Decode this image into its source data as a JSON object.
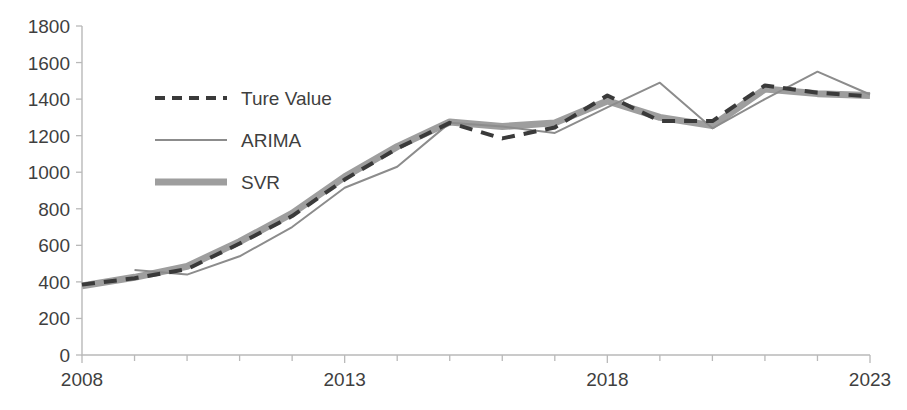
{
  "chart_data": {
    "type": "line",
    "title": "",
    "xlabel": "",
    "ylabel": "",
    "xlim": [
      2008,
      2023
    ],
    "ylim": [
      0,
      1800
    ],
    "grid": false,
    "legend_position": "upper-left-inside",
    "x": [
      2008,
      2009,
      2010,
      2011,
      2012,
      2013,
      2014,
      2015,
      2016,
      2017,
      2018,
      2019,
      2020,
      2021,
      2022,
      2023
    ],
    "xticks": [
      2008,
      2013,
      2018,
      2023
    ],
    "xtick_labels": [
      "2008",
      "2013",
      "2018",
      "2023"
    ],
    "xticks_minor": [
      2009,
      2010,
      2011,
      2012,
      2014,
      2015,
      2016,
      2017,
      2019,
      2020,
      2021,
      2022
    ],
    "yticks": [
      0,
      200,
      400,
      600,
      800,
      1000,
      1200,
      1400,
      1600,
      1800
    ],
    "ytick_labels": [
      "0",
      "200",
      "400",
      "600",
      "800",
      "1000",
      "1200",
      "1400",
      "1600",
      "1800"
    ],
    "series": [
      {
        "name": "Ture Value",
        "style": "dashed",
        "color": "#3a3a3a",
        "width": 4,
        "x": [
          2008,
          2009,
          2010,
          2011,
          2012,
          2013,
          2014,
          2015,
          2016,
          2017,
          2018,
          2019,
          2020,
          2021,
          2022,
          2023
        ],
        "values": [
          385,
          420,
          470,
          610,
          760,
          960,
          1130,
          1270,
          1185,
          1245,
          1420,
          1280,
          1280,
          1475,
          1435,
          1415
        ]
      },
      {
        "name": "ARIMA",
        "style": "solid-thin",
        "color": "#8c8c8c",
        "width": 2,
        "x": [
          2009,
          2010,
          2011,
          2012,
          2013,
          2014,
          2015,
          2016,
          2017,
          2018,
          2019,
          2020,
          2021,
          2022,
          2023
        ],
        "values": [
          465,
          440,
          540,
          700,
          915,
          1030,
          1270,
          1250,
          1215,
          1355,
          1490,
          1240,
          1400,
          1550,
          1425
        ]
      },
      {
        "name": "SVR",
        "style": "solid-thick",
        "color": "#9e9e9e",
        "width": 7,
        "x": [
          2008,
          2009,
          2010,
          2011,
          2012,
          2013,
          2014,
          2015,
          2016,
          2017,
          2018,
          2019,
          2020,
          2021,
          2022,
          2023
        ],
        "values": [
          378,
          425,
          485,
          620,
          775,
          975,
          1140,
          1275,
          1250,
          1270,
          1390,
          1300,
          1255,
          1455,
          1430,
          1420
        ]
      }
    ]
  },
  "legend": {
    "items": [
      {
        "label": "Ture Value",
        "swatch": "dashed",
        "color": "#3a3a3a"
      },
      {
        "label": "ARIMA",
        "swatch": "solid-thin",
        "color": "#8c8c8c"
      },
      {
        "label": "SVR",
        "swatch": "solid-thick",
        "color": "#9e9e9e"
      }
    ]
  },
  "axes": {
    "y_tick_labels": [
      "1800",
      "1600",
      "1400",
      "1200",
      "1000",
      "800",
      "600",
      "400",
      "200",
      "0"
    ],
    "x_tick_labels": [
      "2008",
      "2013",
      "2018",
      "2023"
    ]
  }
}
